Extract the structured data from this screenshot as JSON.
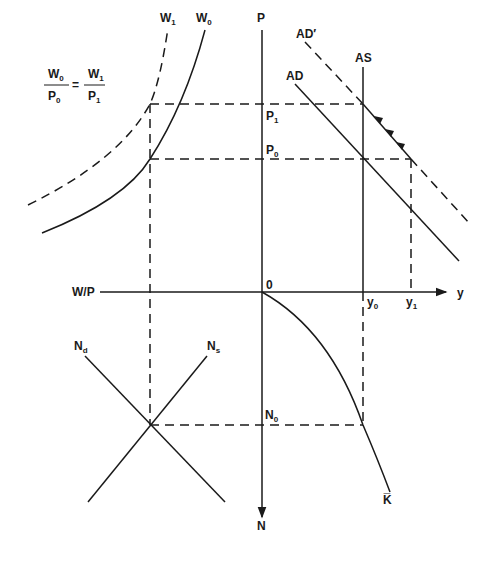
{
  "diagram": {
    "type": "four-quadrant macroeconomic model",
    "equation": {
      "left_num": "W",
      "left_num_sub": "0",
      "left_den": "P",
      "left_den_sub": "0",
      "equals": "=",
      "right_num": "W",
      "right_num_sub": "1",
      "right_den": "P",
      "right_den_sub": "1"
    },
    "axes": {
      "price": "P",
      "output": "y",
      "real_wage": "W/P",
      "labor": "N",
      "origin": "0"
    },
    "curves": {
      "w1": {
        "label": "W",
        "sub": "1",
        "style": "dashed"
      },
      "w0": {
        "label": "W",
        "sub": "0",
        "style": "solid"
      },
      "ad_prime": {
        "label": "AD′",
        "style": "dashed/solid"
      },
      "ad": {
        "label": "AD",
        "style": "solid"
      },
      "as": {
        "label": "AS",
        "style": "solid"
      },
      "nd": {
        "label": "N",
        "sub": "d"
      },
      "ns": {
        "label": "N",
        "sub": "s"
      },
      "kbar": {
        "label": "K̅"
      }
    },
    "levels": {
      "p1": {
        "label": "P",
        "sub": "1"
      },
      "p0": {
        "label": "P",
        "sub": "0"
      },
      "y0": {
        "label": "y",
        "sub": "0"
      },
      "y1": {
        "label": "y",
        "sub": "1"
      },
      "n0": {
        "label": "N",
        "sub": "0"
      }
    }
  }
}
